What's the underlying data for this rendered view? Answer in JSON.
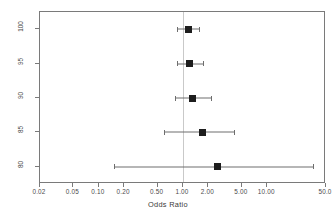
{
  "chart_data": {
    "type": "scatter",
    "subtype": "forest-plot",
    "title": "",
    "xlabel": "Odds Ratio",
    "ylabel": "Specificity(%)",
    "xscale": "log",
    "xlim": [
      0.02,
      50.0
    ],
    "grid": false,
    "legend": null,
    "reference_line": 1.0,
    "x_ticks": [
      0.02,
      0.05,
      0.1,
      0.2,
      0.5,
      1.0,
      2.0,
      5.0,
      10.0,
      50.0
    ],
    "x_tick_labels": [
      "0.02",
      "0.05",
      "0.10",
      "0.20",
      "0.50",
      "1.00",
      "2.00",
      "5.00",
      "10.00",
      "50.0"
    ],
    "y_ticks": [
      100,
      95,
      90,
      85,
      80
    ],
    "y_tick_labels": [
      "100",
      "95",
      "90",
      "85",
      "80"
    ],
    "marker": "filled-square",
    "marker_color": "#1d1d1d",
    "line_color": "#6e6e6e",
    "reference_line_color": "#c9c9c9",
    "points": [
      {
        "label": "100",
        "specificity": 100,
        "odds_ratio": 1.15,
        "ci_low": 0.85,
        "ci_high": 1.55
      },
      {
        "label": "95",
        "specificity": 95,
        "odds_ratio": 1.2,
        "ci_low": 0.85,
        "ci_high": 1.75
      },
      {
        "label": "90",
        "specificity": 90,
        "odds_ratio": 1.3,
        "ci_low": 0.8,
        "ci_high": 2.15
      },
      {
        "label": "85",
        "specificity": 85,
        "odds_ratio": 1.7,
        "ci_low": 0.6,
        "ci_high": 4.0
      },
      {
        "label": "80",
        "specificity": 80,
        "odds_ratio": 2.6,
        "ci_low": 0.15,
        "ci_high": 35.0
      }
    ]
  }
}
